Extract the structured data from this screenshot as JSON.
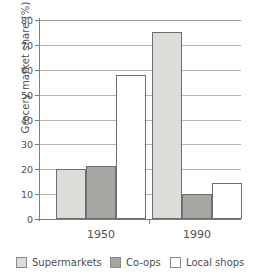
{
  "chart_data": {
    "type": "bar",
    "title": "",
    "xlabel": "",
    "ylabel": "Grocery market share (%)",
    "categories": [
      "1950",
      "1990"
    ],
    "series": [
      {
        "name": "Supermarkets",
        "values": [
          20,
          75
        ],
        "color": "#dcdcd8"
      },
      {
        "name": "Co-ops",
        "values": [
          21.5,
          10
        ],
        "color": "#a6a6a2"
      },
      {
        "name": "Local shops",
        "values": [
          58,
          14.5
        ],
        "color": "#ffffff"
      }
    ],
    "ylim": [
      0,
      80
    ],
    "ytick_step": 10,
    "yticks": [
      "0",
      "10",
      "20",
      "30",
      "40",
      "50",
      "60",
      "70",
      "80"
    ],
    "grid": true,
    "grid_axis": "y",
    "legend_position": "bottom"
  },
  "axis": {
    "y_title": "Grocery market share (%)"
  },
  "legend": {
    "items": [
      {
        "label": "Supermarkets",
        "color": "#dcdcd8"
      },
      {
        "label": "Co-ops",
        "color": "#a6a6a2"
      },
      {
        "label": "Local shops",
        "color": "#ffffff"
      }
    ]
  }
}
